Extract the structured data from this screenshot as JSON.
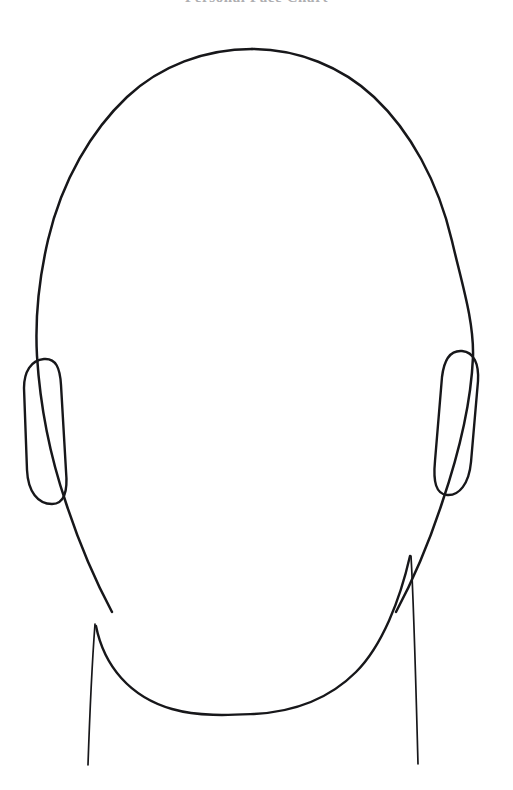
{
  "document": {
    "title": "Personal Face Chart",
    "title_visibility": "cropped-at-top-edge",
    "background_color": "#ffffff",
    "ink_color": "#17171a",
    "title_color": "#6d6d72",
    "canvas": {
      "width": 513,
      "height": 790
    }
  },
  "chart_data": {
    "type": "diagram",
    "title": "Personal Face Chart",
    "style": "hand-drawn ink line art, no fill, no facial features",
    "parts": [
      {
        "name": "cranium-outline",
        "description": "large rounded oval forming skull and cheeks"
      },
      {
        "name": "left-ear",
        "description": "vertical rounded-rectangle ear on viewer left"
      },
      {
        "name": "right-ear",
        "description": "vertical rounded-rectangle ear on viewer right"
      },
      {
        "name": "jawline",
        "description": "U-shaped chin and jaw curve"
      },
      {
        "name": "left-neck-line",
        "description": "slightly curved line descending from left jaw"
      },
      {
        "name": "right-neck-line",
        "description": "slightly curved line descending from right jaw"
      }
    ],
    "geometry": {
      "head_top_y": 48,
      "head_left_x": 35,
      "head_right_x": 474,
      "chin_y": 712,
      "left_ear_bounds": [
        23,
        358,
        64,
        505
      ],
      "right_ear_bounds": [
        440,
        350,
        478,
        495
      ],
      "neck_bottom_y": 765
    },
    "annotations": [],
    "legend": []
  },
  "paths": {
    "head": "M 252 49 C 205 49 160 66 127 97 C 92 130 62 180 48 240 C 38 283 35 320 37 356 C 40 404 50 456 66 503 C 80 546 96 582 112 612",
    "head_right": "M 252 49 C 298 49 342 67 374 97 C 410 131 438 181 452 241 C 462 284 474 321 473 357 C 471 404 458 456 442 503 C 428 546 412 582 396 612",
    "jaw": "M 96 626 C 104 666 130 697 172 709 C 200 717 232 715 254 714 C 292 712 328 700 356 672 C 382 646 400 600 410 556",
    "left_ear": "M 44 359 C 31 360 24 372 24 388 L 27 470 C 28 492 38 504 52 504 C 64 504 68 492 66 471 L 61 385 C 60 368 56 358 44 359 Z",
    "right_ear": "M 462 351 C 474 352 479 364 478 381 L 471 462 C 469 484 459 496 447 495 C 436 494 433 482 435 461 L 442 377 C 444 360 450 350 462 351 Z",
    "left_neck": "M 95 624 C 92 664 90 706 88 765",
    "right_neck": "M 411 556 C 414 608 416 690 418 764"
  }
}
